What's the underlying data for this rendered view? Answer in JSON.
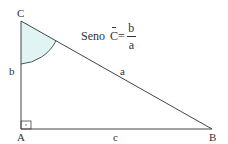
{
  "diagram": {
    "type": "right-triangle",
    "vertices": {
      "A": "A",
      "B": "B",
      "C": "C"
    },
    "sides": {
      "a": "a",
      "b": "b",
      "c": "c"
    },
    "right_angle_at": "A",
    "marked_angle_at": "C",
    "colors": {
      "line": "#444444",
      "angle_fill": "#e0f4f4",
      "text": "#333333"
    }
  },
  "formula": {
    "prefix": "Seno",
    "angle": "C",
    "equals": "=",
    "numerator": "b",
    "denominator": "a"
  }
}
